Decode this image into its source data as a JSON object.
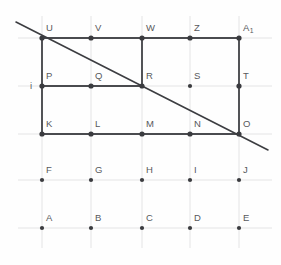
{
  "figure": {
    "title": "Lattice point diagram with polygon and transversal line",
    "background_color": "#fefefe",
    "grid": {
      "line_color": "#dedee0",
      "line_width": 0.8,
      "columns_x": [
        42,
        91,
        142,
        190,
        239
      ],
      "rows_y": [
        38,
        86,
        134,
        180,
        228
      ],
      "h_extent": [
        18,
        272
      ],
      "v_extent": [
        16,
        248
      ],
      "visible": true
    },
    "style": {
      "edge_color": "#4a4b4f",
      "edge_width": 1.9,
      "diagonal_color": "#3c3d41",
      "diagonal_width": 1.6,
      "dot_color": "#3a3b3f",
      "dot_radius": 2.6,
      "small_dot_radius": 2.1,
      "label_color": "#57585c"
    },
    "points": [
      {
        "name": "U",
        "label": "U",
        "x": 42,
        "y": 38,
        "lx": 46,
        "ly": 31,
        "emphasis": "major"
      },
      {
        "name": "V",
        "label": "V",
        "x": 91,
        "y": 38,
        "lx": 95,
        "ly": 31,
        "emphasis": "major"
      },
      {
        "name": "W",
        "label": "W",
        "x": 142,
        "y": 38,
        "lx": 146,
        "ly": 31,
        "emphasis": "major"
      },
      {
        "name": "Z",
        "label": "Z",
        "x": 190,
        "y": 38,
        "lx": 194,
        "ly": 31,
        "emphasis": "major"
      },
      {
        "name": "A1",
        "label": "A",
        "sub": "1",
        "x": 239,
        "y": 38,
        "lx": 243,
        "ly": 31,
        "emphasis": "major"
      },
      {
        "name": "P",
        "label": "P",
        "x": 42,
        "y": 86,
        "lx": 46,
        "ly": 79,
        "emphasis": "major"
      },
      {
        "name": "Q",
        "label": "Q",
        "x": 91,
        "y": 86,
        "lx": 95,
        "ly": 79,
        "emphasis": "major"
      },
      {
        "name": "R",
        "label": "R",
        "x": 142,
        "y": 86,
        "lx": 146,
        "ly": 79,
        "emphasis": "major"
      },
      {
        "name": "S",
        "label": "S",
        "x": 190,
        "y": 86,
        "lx": 194,
        "ly": 79,
        "emphasis": "minor"
      },
      {
        "name": "T",
        "label": "T",
        "x": 239,
        "y": 86,
        "lx": 243,
        "ly": 79,
        "emphasis": "major"
      },
      {
        "name": "K",
        "label": "K",
        "x": 42,
        "y": 134,
        "lx": 46,
        "ly": 127,
        "emphasis": "major"
      },
      {
        "name": "L",
        "label": "L",
        "x": 91,
        "y": 134,
        "lx": 95,
        "ly": 127,
        "emphasis": "major"
      },
      {
        "name": "M",
        "label": "M",
        "x": 142,
        "y": 134,
        "lx": 146,
        "ly": 127,
        "emphasis": "major"
      },
      {
        "name": "N",
        "label": "N",
        "x": 190,
        "y": 134,
        "lx": 194,
        "ly": 127,
        "emphasis": "major"
      },
      {
        "name": "O",
        "label": "O",
        "x": 239,
        "y": 134,
        "lx": 243,
        "ly": 127,
        "emphasis": "major"
      },
      {
        "name": "F",
        "label": "F",
        "x": 42,
        "y": 180,
        "lx": 46,
        "ly": 173,
        "emphasis": "minor"
      },
      {
        "name": "G",
        "label": "G",
        "x": 91,
        "y": 180,
        "lx": 95,
        "ly": 173,
        "emphasis": "minor"
      },
      {
        "name": "H",
        "label": "H",
        "x": 142,
        "y": 180,
        "lx": 146,
        "ly": 173,
        "emphasis": "minor"
      },
      {
        "name": "I",
        "label": "I",
        "x": 190,
        "y": 180,
        "lx": 194,
        "ly": 173,
        "emphasis": "minor"
      },
      {
        "name": "J",
        "label": "J",
        "x": 239,
        "y": 180,
        "lx": 243,
        "ly": 173,
        "emphasis": "minor"
      },
      {
        "name": "A",
        "label": "A",
        "x": 42,
        "y": 228,
        "lx": 46,
        "ly": 221,
        "emphasis": "minor"
      },
      {
        "name": "B",
        "label": "B",
        "x": 91,
        "y": 228,
        "lx": 95,
        "ly": 221,
        "emphasis": "minor"
      },
      {
        "name": "C",
        "label": "C",
        "x": 142,
        "y": 228,
        "lx": 146,
        "ly": 221,
        "emphasis": "minor"
      },
      {
        "name": "D",
        "label": "D",
        "x": 190,
        "y": 228,
        "lx": 194,
        "ly": 221,
        "emphasis": "minor"
      },
      {
        "name": "E",
        "label": "E",
        "x": 239,
        "y": 228,
        "lx": 243,
        "ly": 221,
        "emphasis": "minor"
      }
    ],
    "extra_labels": [
      {
        "name": "i",
        "label": "i",
        "lx": 30,
        "ly": 89
      }
    ],
    "edges": [
      {
        "name": "edge-U-A1",
        "x1": 42,
        "y1": 38,
        "x2": 239,
        "y2": 38
      },
      {
        "name": "edge-U-K",
        "x1": 42,
        "y1": 38,
        "x2": 42,
        "y2": 134
      },
      {
        "name": "edge-A1-O",
        "x1": 239,
        "y1": 38,
        "x2": 239,
        "y2": 134
      },
      {
        "name": "edge-K-O",
        "x1": 42,
        "y1": 134,
        "x2": 239,
        "y2": 134
      },
      {
        "name": "edge-P-R",
        "x1": 42,
        "y1": 86,
        "x2": 142,
        "y2": 86
      },
      {
        "name": "edge-W-R",
        "x1": 142,
        "y1": 38,
        "x2": 142,
        "y2": 86
      }
    ],
    "diagonal": {
      "name": "transversal-line",
      "x1": 16,
      "y1": 22,
      "x2": 268,
      "y2": 150,
      "passes_through": [
        "U",
        "R",
        "O"
      ]
    }
  }
}
